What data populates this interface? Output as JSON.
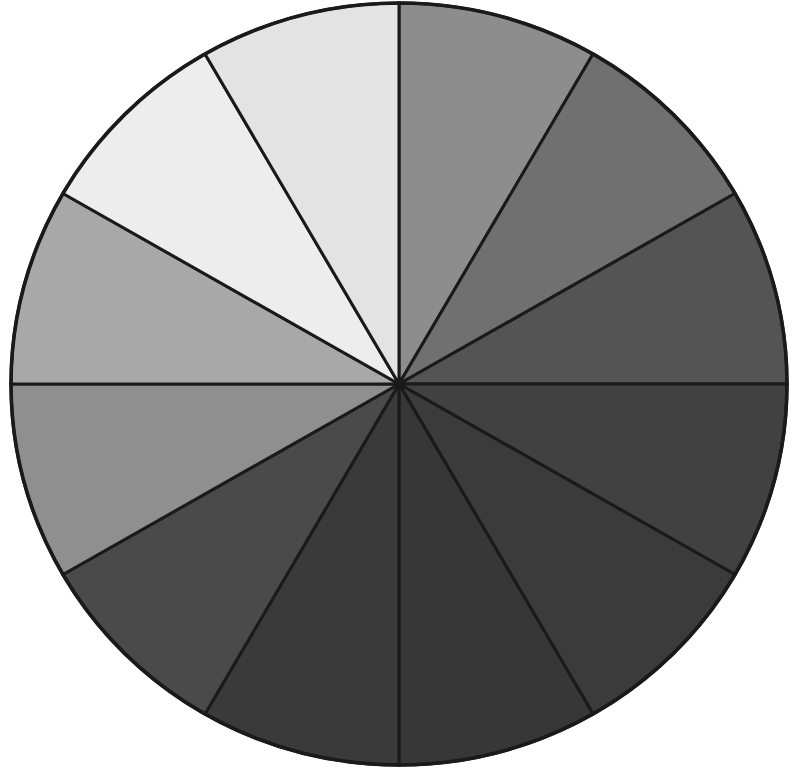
{
  "figure": {
    "name": "grayscale-sector-wheel",
    "title": "",
    "background_color": "#ffffff",
    "stroke_color": "#1a1a1a",
    "stroke_width": 3.0,
    "center_x": 399,
    "center_y": 384,
    "radius_x": 388,
    "radius_y": 381,
    "sector_count": 12,
    "sector_angle_deg": 30,
    "start_angle_deg": 0
  },
  "chart_data": {
    "type": "pie",
    "title": "",
    "subtitle": "",
    "xlabel": "",
    "ylabel": "",
    "grid": false,
    "legend": "none",
    "labels_shown": false,
    "equal_slices": true,
    "total": 12,
    "categories": [
      "0-30",
      "30-60",
      "60-90",
      "90-120",
      "120-150",
      "150-180",
      "180-210",
      "210-240",
      "240-270",
      "270-300",
      "300-330",
      "330-360"
    ],
    "values": [
      1,
      1,
      1,
      1,
      1,
      1,
      1,
      1,
      1,
      1,
      1,
      1
    ],
    "percentages": [
      "8.33",
      "8.33",
      "8.33",
      "8.33",
      "8.33",
      "8.33",
      "8.33",
      "8.33",
      "8.33",
      "8.33",
      "8.33",
      "8.33"
    ],
    "slice_colors": [
      "#8d8d8d",
      "#707070",
      "#545454",
      "#414141",
      "#3b3b3b",
      "#373737",
      "#3a3a3a",
      "#4a4a4a",
      "#8f8f8f",
      "#a8a8a8",
      "#ededed",
      "#e3e3e3"
    ],
    "slices": [
      {
        "index": 1,
        "start_deg": 0,
        "end_deg": 30,
        "color": "#8d8d8d",
        "gray_level": 141
      },
      {
        "index": 2,
        "start_deg": 30,
        "end_deg": 60,
        "color": "#707070",
        "gray_level": 112
      },
      {
        "index": 3,
        "start_deg": 60,
        "end_deg": 90,
        "color": "#545454",
        "gray_level": 84
      },
      {
        "index": 4,
        "start_deg": 90,
        "end_deg": 120,
        "color": "#414141",
        "gray_level": 65
      },
      {
        "index": 5,
        "start_deg": 120,
        "end_deg": 150,
        "color": "#3b3b3b",
        "gray_level": 59
      },
      {
        "index": 6,
        "start_deg": 150,
        "end_deg": 180,
        "color": "#373737",
        "gray_level": 55
      },
      {
        "index": 7,
        "start_deg": 180,
        "end_deg": 210,
        "color": "#3a3a3a",
        "gray_level": 58
      },
      {
        "index": 8,
        "start_deg": 210,
        "end_deg": 240,
        "color": "#4a4a4a",
        "gray_level": 74
      },
      {
        "index": 9,
        "start_deg": 240,
        "end_deg": 270,
        "color": "#8f8f8f",
        "gray_level": 143
      },
      {
        "index": 10,
        "start_deg": 270,
        "end_deg": 300,
        "color": "#a8a8a8",
        "gray_level": 168
      },
      {
        "index": 11,
        "start_deg": 300,
        "end_deg": 330,
        "color": "#ededed",
        "gray_level": 237
      },
      {
        "index": 12,
        "start_deg": 330,
        "end_deg": 360,
        "color": "#e3e3e3",
        "gray_level": 227
      }
    ],
    "annotations": []
  }
}
